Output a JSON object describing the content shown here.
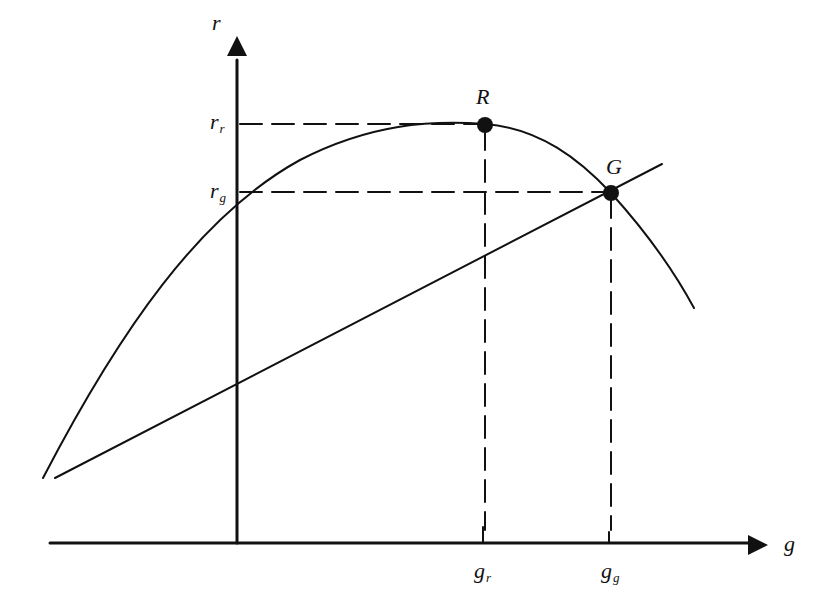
{
  "diagram": {
    "type": "economics-curve-diagram",
    "axes": {
      "x_label": "g",
      "y_label": "r"
    },
    "points": [
      {
        "name": "R",
        "label": "R",
        "x_tick": "g",
        "x_tick_sub": "r",
        "y_tick": "r",
        "y_tick_sub": "r"
      },
      {
        "name": "G",
        "label": "G",
        "x_tick": "g",
        "x_tick_sub": "g",
        "y_tick": "r",
        "y_tick_sub": "g"
      }
    ],
    "curves": [
      {
        "name": "hump-curve",
        "description": "concave curve peaking at R, passing through G"
      },
      {
        "name": "straight-line",
        "description": "upward sloping line through G"
      }
    ],
    "colors": {
      "ink": "#111111",
      "background": "#ffffff"
    }
  },
  "labels": {
    "y_axis": "r",
    "x_axis": "g",
    "r_r_main": "r",
    "r_r_sub": "r",
    "r_g_main": "r",
    "r_g_sub": "g",
    "g_r_main": "g",
    "g_r_sub": "r",
    "g_g_main": "g",
    "g_g_sub": "g",
    "point_R": "R",
    "point_G": "G"
  }
}
